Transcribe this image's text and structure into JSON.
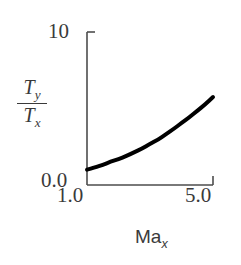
{
  "chart_data": {
    "type": "line",
    "title": "",
    "xlabel": "Ma_x",
    "ylabel": "T_y / T_x",
    "xlim": [
      1.0,
      5.0
    ],
    "ylim": [
      0.0,
      10.0
    ],
    "grid": false,
    "legend": null,
    "x_ticks": [
      "1.0",
      "5.0"
    ],
    "y_ticks": [
      "0.0",
      "10"
    ],
    "series": [
      {
        "name": "Ty/Tx vs Max",
        "x": [
          1.0,
          1.25,
          1.5,
          1.75,
          2.0,
          2.25,
          2.5,
          2.75,
          3.0,
          3.25,
          3.5,
          3.75,
          4.0,
          4.25,
          4.5,
          4.75,
          5.0
        ],
        "values": [
          1.0,
          1.15,
          1.32,
          1.52,
          1.69,
          1.9,
          2.14,
          2.38,
          2.68,
          2.96,
          3.31,
          3.66,
          4.05,
          4.42,
          4.85,
          5.27,
          5.75
        ],
        "color": "#000000",
        "line_width": 4
      }
    ]
  },
  "axes": {
    "y_top_tick_label": "10",
    "y_bottom_tick_label": "0.0",
    "x_left_tick_label": "1.0",
    "x_right_tick_label": "5.0",
    "y_title_numerator": "T",
    "y_title_numerator_sub": "y",
    "y_title_denominator": "T",
    "y_title_denominator_sub": "x",
    "x_title_main": "Ma",
    "x_title_sub": "x",
    "axis_color": "#4d4d4d",
    "text_color": "#3a3a3a",
    "curve_color": "#000000",
    "background": "#ffffff"
  }
}
